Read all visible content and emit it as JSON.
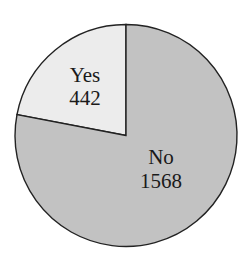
{
  "chart_data": {
    "type": "pie",
    "title": "",
    "categories": [
      "Yes",
      "No"
    ],
    "values": [
      442,
      1568
    ],
    "total": 2010,
    "colors": {
      "Yes": "#ececec",
      "No": "#c2c2c2"
    },
    "start_angle": "12 o'clock, Yes slice counterclockwise",
    "labels_inside": true,
    "legend": "none"
  },
  "slices": [
    {
      "label": "Yes",
      "value": "442"
    },
    {
      "label": "No",
      "value": "1568"
    }
  ],
  "style": {
    "background": "#ffffff",
    "stroke": "#222222"
  }
}
